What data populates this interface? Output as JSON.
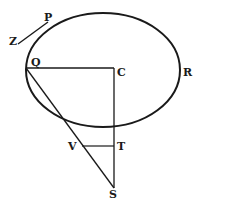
{
  "diagram": {
    "type": "geometric-figure",
    "labels": {
      "P": "P",
      "Z": "Z",
      "Q": "Q",
      "C": "C",
      "R": "R",
      "V": "V",
      "T": "T",
      "S": "S"
    },
    "colors": {
      "stroke": "#1a1a1a",
      "background": "#ffffff"
    }
  }
}
